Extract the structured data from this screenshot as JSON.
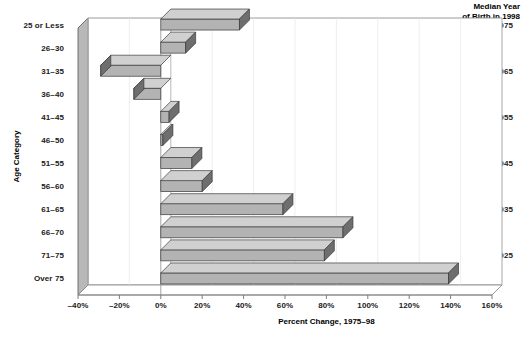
{
  "right_header": {
    "line1": "Median Year",
    "line2": "of Birth in 1998"
  },
  "axes": {
    "y_title": "Age Category",
    "x_title": "Percent Change, 1975–98",
    "x_ticks": [
      "–40%",
      "–20%",
      "0%",
      "20%",
      "40%",
      "60%",
      "80%",
      "100%",
      "120%",
      "140%",
      "160%"
    ],
    "x_tick_values": [
      -40,
      -20,
      0,
      20,
      40,
      60,
      80,
      100,
      120,
      140,
      160
    ]
  },
  "year_labels": [
    {
      "row": 0,
      "text": "1975"
    },
    {
      "row": 2,
      "text": "1965"
    },
    {
      "row": 4,
      "text": "1955"
    },
    {
      "row": 6,
      "text": "1945"
    },
    {
      "row": 8,
      "text": "1935"
    },
    {
      "row": 10,
      "text": "1925"
    }
  ],
  "style": {
    "bar_face": "#b3b3b3",
    "bar_top": "#d0d0d0",
    "bar_side": "#6e6e6e",
    "bar_outline": "#3a3a3a",
    "wall_face": "#f7f7f7",
    "wall_side": "#9b9b9b",
    "axis_line": "#808080",
    "grid_line": "#c8c8c8"
  },
  "chart_data": {
    "type": "bar",
    "title": "",
    "xlabel": "Percent Change, 1975–98",
    "ylabel": "Age Category",
    "orientation": "horizontal",
    "xlim": [
      -40,
      160
    ],
    "grid": true,
    "legend": null,
    "categories": [
      "25 or Less",
      "26–30",
      "31–35",
      "36–40",
      "41–45",
      "46–50",
      "51–55",
      "56–60",
      "61–65",
      "66–70",
      "71–75",
      "Over 75"
    ],
    "values": [
      38,
      12,
      -29,
      -13,
      4,
      1,
      15,
      20,
      59,
      88,
      79,
      139
    ],
    "annotations": {
      "median_year_of_birth": {
        "25 or Less": "1975",
        "31–35": "1965",
        "41–45": "1955",
        "51–55": "1945",
        "61–65": "1935",
        "71–75": "1925"
      }
    }
  }
}
